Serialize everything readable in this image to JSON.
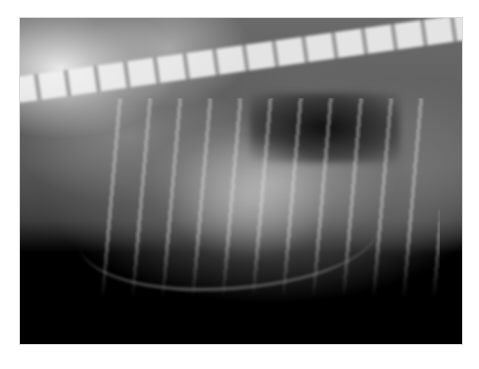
{
  "image": {
    "subject": "lateral thoracic radiograph",
    "description": "Grayscale X-ray showing spine along top, ribs, dark lung fields, cardiac silhouette, dark background at bottom",
    "background_color": "#ffffff",
    "frame": {
      "left": 20,
      "top": 18,
      "width": 442,
      "height": 326
    },
    "palette": {
      "bone": "#f2f2f2",
      "soft_tissue": "#8a8a8a",
      "air": "#000000"
    }
  }
}
